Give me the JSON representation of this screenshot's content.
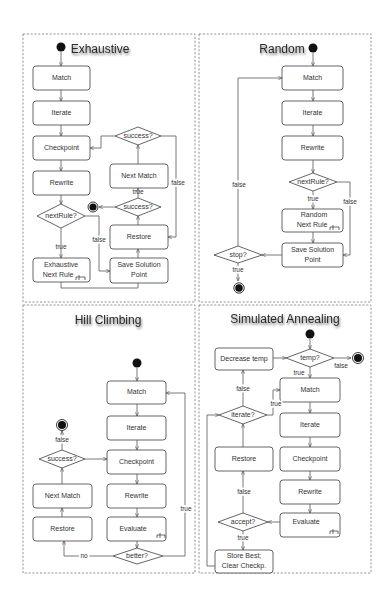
{
  "diagram": {
    "quadrants": {
      "exhaustive": {
        "title": "Exhaustive",
        "nodes": {
          "match": "Match",
          "iterate": "Iterate",
          "checkpoint": "Checkpoint",
          "rewrite": "Rewrite",
          "next_rule_decision": "nextRule?",
          "exhaustive_next_rule_line1": "Exhaustive",
          "exhaustive_next_rule_line2": "Next Rule",
          "save_solution_line1": "Save Solution",
          "save_solution_line2": "Point",
          "restore": "Restore",
          "success_lower": "success?",
          "next_match": "Next Match",
          "success_upper": "success?"
        },
        "edges": {
          "next_rule_true": "true",
          "next_rule_false": "false",
          "success_lower_true": "true",
          "success_upper_false": "false"
        }
      },
      "random": {
        "title": "Random",
        "nodes": {
          "match": "Match",
          "iterate": "Iterate",
          "rewrite": "Rewrite",
          "next_rule_decision": "nextRule?",
          "random_next_rule_line1": "Random",
          "random_next_rule_line2": "Next Rule",
          "save_solution_line1": "Save Solution",
          "save_solution_line2": "Point",
          "stop_decision": "stop?"
        },
        "edges": {
          "next_rule_true": "true",
          "next_rule_false": "false",
          "stop_true": "true",
          "stop_false": "false"
        }
      },
      "hill_climbing": {
        "title": "Hill Climbing",
        "nodes": {
          "match": "Match",
          "iterate": "Iterate",
          "checkpoint": "Checkpoint",
          "rewrite": "Rewrite",
          "evaluate": "Evaluate",
          "better_decision": "better?",
          "restore": "Restore",
          "next_match": "Next Match",
          "success_decision": "success?"
        },
        "edges": {
          "better_true": "true",
          "better_no": "no",
          "success_false": "false"
        }
      },
      "simulated_annealing": {
        "title": "Simulated Annealing",
        "nodes": {
          "temp_decision": "temp?",
          "decrease_temp": "Decrease temp",
          "match": "Match",
          "iterate_decision": "iterate?",
          "iterate": "Iterate",
          "checkpoint": "Checkpoint",
          "rewrite": "Rewrite",
          "evaluate": "Evaluate",
          "restore": "Restore",
          "accept_decision": "accept?",
          "store_best_line1": "Store Best;",
          "store_best_line2": "Clear Checkp."
        },
        "edges": {
          "temp_true": "true",
          "temp_false": "false",
          "iterate_true": "true",
          "iterate_false": "false",
          "accept_true": "true",
          "accept_false": "false"
        }
      }
    },
    "colors": {
      "stroke": "#555555",
      "frame": "#8a8a8a",
      "node_fill": "#ffffff",
      "dot": "#111111"
    }
  }
}
